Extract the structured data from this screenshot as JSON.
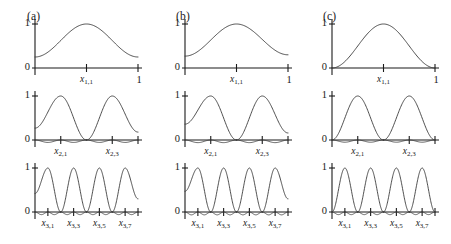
{
  "figure": {
    "width": 451,
    "height": 244,
    "background": "#ffffff",
    "curve_color": "#3a3a3a",
    "axis_color": "#1a1a1a",
    "panels": [
      {
        "label": "(a)",
        "key": "a"
      },
      {
        "label": "(b)",
        "key": "b"
      },
      {
        "label": "(c)",
        "key": "c"
      }
    ],
    "rows": [
      {
        "key": "level1",
        "ytick_labels": [
          "1",
          "0"
        ],
        "xtick_right_label": "1",
        "node_labels": [
          {
            "base": "x",
            "sub": "1,1"
          }
        ]
      },
      {
        "key": "level2",
        "ytick_labels": [
          "1",
          "0"
        ],
        "xtick_right_label": "",
        "node_labels": [
          {
            "base": "x",
            "sub": "2,1"
          },
          {
            "base": "x",
            "sub": "2,3"
          }
        ]
      },
      {
        "key": "level3",
        "ytick_labels": [
          "1",
          "0"
        ],
        "xtick_right_label": "",
        "node_labels": [
          {
            "base": "x",
            "sub": "3,1"
          },
          {
            "base": "x",
            "sub": "3,3"
          },
          {
            "base": "x",
            "sub": "3,5"
          },
          {
            "base": "x",
            "sub": "3,7"
          }
        ]
      }
    ]
  },
  "chart_data": {
    "type": "line",
    "title": "",
    "xlabel": "",
    "ylabel": "",
    "xlim": [
      0,
      1
    ],
    "ylim": [
      -0.12,
      1.05
    ],
    "grid": false,
    "legend": "none",
    "axis_ticks": {
      "y": [
        0,
        1
      ],
      "x_right": 1
    },
    "panels": [
      {
        "panel": "(a)",
        "rows": [
          {
            "level": 1,
            "n_bumps": 1,
            "nodes": [
              0.5
            ],
            "node_labels": [
              "x1,1"
            ],
            "peak_values": [
              1.0
            ],
            "left_endpoint_value": 0.25,
            "right_endpoint_value": 0.25,
            "has_negative_lobes": false,
            "negative_lobe_depth": 0
          },
          {
            "level": 2,
            "n_bumps": 2,
            "nodes": [
              0.25,
              0.75
            ],
            "node_labels": [
              "x2,1",
              "x2,3"
            ],
            "peak_values": [
              1.0,
              1.0
            ],
            "left_endpoint_value": 0.27,
            "right_endpoint_value": 0.18,
            "has_negative_lobes": true,
            "negative_lobe_depth": -0.055
          },
          {
            "level": 3,
            "n_bumps": 4,
            "nodes": [
              0.125,
              0.375,
              0.625,
              0.875
            ],
            "node_labels": [
              "x3,1",
              "x3,3",
              "x3,5",
              "x3,7"
            ],
            "peak_values": [
              1.0,
              1.0,
              1.0,
              1.0
            ],
            "left_endpoint_value": 0.42,
            "right_endpoint_value": 0.3,
            "has_negative_lobes": true,
            "negative_lobe_depth": -0.06
          }
        ]
      },
      {
        "panel": "(b)",
        "rows": [
          {
            "level": 1,
            "n_bumps": 1,
            "nodes": [
              0.5
            ],
            "node_labels": [
              "x1,1"
            ],
            "peak_values": [
              1.0
            ],
            "left_endpoint_value": 0.27,
            "right_endpoint_value": 0.3,
            "has_negative_lobes": false,
            "negative_lobe_depth": 0
          },
          {
            "level": 2,
            "n_bumps": 2,
            "nodes": [
              0.25,
              0.75
            ],
            "node_labels": [
              "x2,1",
              "x2,3"
            ],
            "peak_values": [
              1.0,
              1.0
            ],
            "left_endpoint_value": 0.36,
            "right_endpoint_value": 0.16,
            "has_negative_lobes": true,
            "negative_lobe_depth": -0.06
          },
          {
            "level": 3,
            "n_bumps": 4,
            "nodes": [
              0.125,
              0.375,
              0.625,
              0.875
            ],
            "node_labels": [
              "x3,1",
              "x3,3",
              "x3,5",
              "x3,7"
            ],
            "peak_values": [
              1.0,
              1.0,
              1.0,
              1.0
            ],
            "left_endpoint_value": 0.47,
            "right_endpoint_value": 0.3,
            "has_negative_lobes": true,
            "negative_lobe_depth": -0.065
          }
        ]
      },
      {
        "panel": "(c)",
        "rows": [
          {
            "level": 1,
            "n_bumps": 1,
            "nodes": [
              0.5
            ],
            "node_labels": [
              "x1,1"
            ],
            "peak_values": [
              1.0
            ],
            "left_endpoint_value": 0.0,
            "right_endpoint_value": 0.0,
            "has_negative_lobes": false,
            "negative_lobe_depth": 0
          },
          {
            "level": 2,
            "n_bumps": 2,
            "nodes": [
              0.25,
              0.75
            ],
            "node_labels": [
              "x2,1",
              "x2,3"
            ],
            "peak_values": [
              1.0,
              1.0
            ],
            "left_endpoint_value": 0.0,
            "right_endpoint_value": 0.0,
            "has_negative_lobes": true,
            "negative_lobe_depth": -0.05
          },
          {
            "level": 3,
            "n_bumps": 4,
            "nodes": [
              0.125,
              0.375,
              0.625,
              0.875
            ],
            "node_labels": [
              "x3,1",
              "x3,3",
              "x3,5",
              "x3,7"
            ],
            "peak_values": [
              1.0,
              1.0,
              1.0,
              1.0
            ],
            "left_endpoint_value": 0.0,
            "right_endpoint_value": 0.0,
            "has_negative_lobes": true,
            "negative_lobe_depth": -0.06
          }
        ]
      }
    ]
  }
}
